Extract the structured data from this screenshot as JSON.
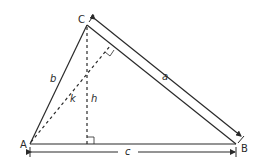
{
  "diagram": {
    "type": "triangle-geometry",
    "vertices": {
      "A": {
        "label": "A",
        "x": 30,
        "y": 144
      },
      "B": {
        "label": "B",
        "x": 236,
        "y": 144
      },
      "C": {
        "label": "C",
        "x": 87,
        "y": 25
      }
    },
    "sides": {
      "a": {
        "label": "a",
        "from": "C",
        "to": "B"
      },
      "b": {
        "label": "b",
        "from": "A",
        "to": "C"
      },
      "c": {
        "label": "c",
        "from": "A",
        "to": "B"
      }
    },
    "segments": {
      "h": {
        "label": "h",
        "description": "altitude from C to AB",
        "style": "dashed"
      },
      "k": {
        "label": "k",
        "description": "altitude from A to BC",
        "style": "dashed"
      }
    },
    "colors": {
      "stroke": "#2a2a2a",
      "background": "#ffffff"
    }
  }
}
